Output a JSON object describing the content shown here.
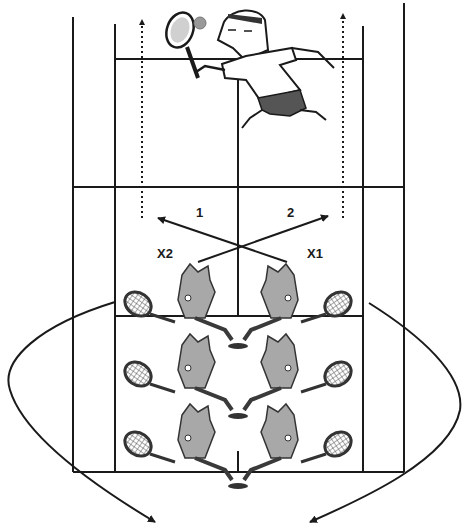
{
  "diagram": {
    "type": "tennis-court-drill",
    "colors": {
      "line": "#1a1a1a",
      "figure_fill": "#a8a8a8",
      "figure_dark": "#3a3a3a",
      "background": "#ffffff"
    }
  },
  "labels": {
    "path1": "1",
    "path2": "2",
    "player_x2": "X2",
    "player_x1": "X1"
  },
  "elements": {
    "feeder": "coach-hitting-ball",
    "net_players": [
      "X2",
      "X1"
    ],
    "queue_left_count": 3,
    "queue_right_count": 3,
    "paths": [
      {
        "id": "1",
        "from": "X1",
        "to": "left-deep",
        "style": "solid-arrow"
      },
      {
        "id": "2",
        "from": "X2",
        "to": "right-deep",
        "style": "solid-arrow"
      }
    ],
    "rotation_arrows": [
      "left-loop-to-back",
      "right-loop-to-back"
    ],
    "alley_runs": [
      "left-dotted-up",
      "right-dotted-up"
    ]
  }
}
